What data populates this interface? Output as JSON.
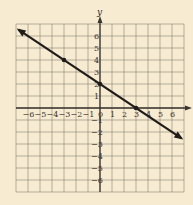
{
  "chart_data": {
    "type": "line",
    "title": "",
    "xlabel": "x",
    "ylabel": "y",
    "xlim": [
      -7,
      7
    ],
    "ylim": [
      -7,
      7
    ],
    "grid": true,
    "x_ticks": [
      -6,
      -5,
      -4,
      -3,
      -2,
      -1,
      0,
      1,
      2,
      3,
      4,
      5,
      6
    ],
    "y_ticks": [
      -6,
      -5,
      -4,
      -3,
      -2,
      -1,
      1,
      2,
      3,
      4,
      5,
      6
    ],
    "series": [
      {
        "name": "line",
        "equation": "y = -2/3 x + 2",
        "slope": -0.6667,
        "y_intercept": 2,
        "x_intercept": 3,
        "marked_points": [
          [
            -3,
            4
          ],
          [
            0,
            2
          ],
          [
            3,
            0
          ]
        ],
        "endpoints_with_arrows": [
          [
            -6.8,
            6.53
          ],
          [
            6.8,
            -2.53
          ]
        ]
      }
    ]
  },
  "colors": {
    "background": "#f7ecd2",
    "grid": "#8a7f72",
    "axis": "#3a3530",
    "line": "#1f1c1a"
  }
}
